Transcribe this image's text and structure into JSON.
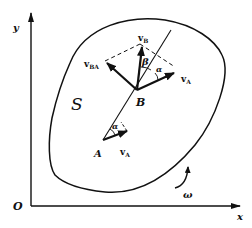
{
  "diagram": {
    "type": "rigid-body-velocity-diagram",
    "axes": {
      "origin_label": "O",
      "x_label": "x",
      "y_label": "y"
    },
    "body_label": "S",
    "points": {
      "A": "A",
      "B": "B"
    },
    "vectors": {
      "vA_at_A": {
        "main": "v",
        "sub": "A"
      },
      "vA_at_B": {
        "main": "v",
        "sub": "A"
      },
      "vB": {
        "main": "v",
        "sub": "B"
      },
      "vBA": {
        "main": "v",
        "sub": "BA"
      }
    },
    "angles": {
      "alpha_at_A": "α",
      "alpha_at_B": "α",
      "beta_at_B": "β"
    },
    "rotation_label": "ω",
    "colors": {
      "ink": "#111111",
      "background": "#ffffff"
    }
  }
}
